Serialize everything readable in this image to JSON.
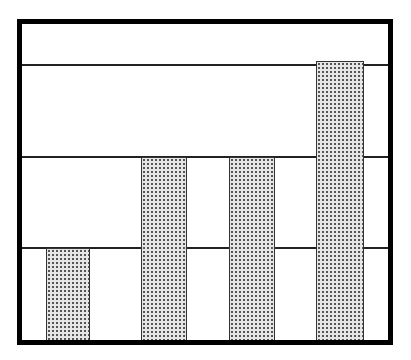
{
  "chart_data": {
    "type": "bar",
    "title": "",
    "xlabel": "",
    "ylabel": "",
    "categories": [
      "1",
      "2",
      "3",
      "4"
    ],
    "values": [
      1,
      2,
      2,
      3.05
    ],
    "ylim": [
      0,
      3.45
    ],
    "grid": true,
    "gridlines": [
      1,
      2,
      3
    ],
    "legend": null,
    "bar_fill": "stippled gray",
    "tick_labels_visible": false
  },
  "colors": {
    "frame": "#000000",
    "bar": "#e6e6e6",
    "bar_dots": "#555555",
    "grid": "#222222"
  }
}
